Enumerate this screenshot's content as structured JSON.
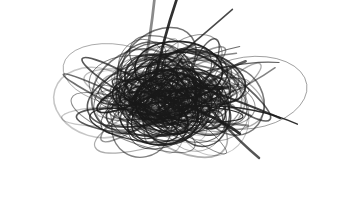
{
  "image": {
    "description": "Dense chaotic pencil scribble on white background",
    "width": 344,
    "height": 197,
    "background": "#ffffff",
    "ink_color": "#1a1a1a"
  },
  "scribble": {
    "center": [
      170,
      95
    ],
    "core_radius": [
      55,
      38
    ],
    "extent_radius": [
      150,
      80
    ],
    "loop_count": 150,
    "stroke_count": 22,
    "seed": 7
  }
}
